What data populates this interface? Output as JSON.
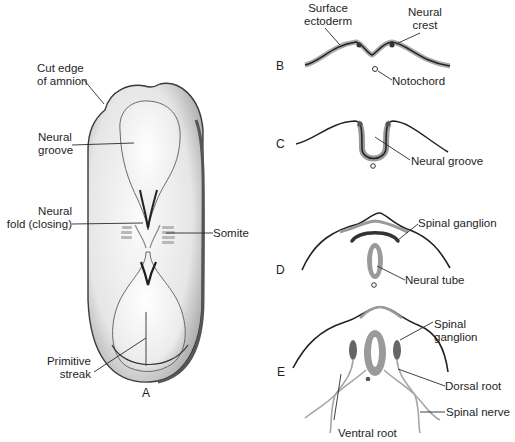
{
  "figure": {
    "panels": {
      "A": "A",
      "B": "B",
      "C": "C",
      "D": "D",
      "E": "E"
    },
    "panel_A": {
      "cut_edge_1": "Cut edge",
      "cut_edge_2": "of amnion",
      "neural_groove_1": "Neural",
      "neural_groove_2": "groove",
      "neural_fold_1": "Neural",
      "neural_fold_2": "fold (closing)",
      "somite": "Somite",
      "primitive_streak_1": "Primitive",
      "primitive_streak_2": "streak"
    },
    "panel_B": {
      "surface_ectoderm_1": "Surface",
      "surface_ectoderm_2": "ectoderm",
      "neural_crest_1": "Neural",
      "neural_crest_2": "crest",
      "notochord": "Notochord"
    },
    "panel_C": {
      "neural_groove": "Neural groove"
    },
    "panel_D": {
      "spinal_ganglion": "Spinal ganglion",
      "neural_tube": "Neural tube"
    },
    "panel_E": {
      "spinal_ganglion_1": "Spinal",
      "spinal_ganglion_2": "ganglion",
      "dorsal_root": "Dorsal root",
      "spinal_nerve": "Spinal nerve",
      "ventral_root": "Ventral root"
    },
    "colors": {
      "ectoderm": "#2a2a2a",
      "neural_tissue": "#9a9a9a",
      "embryo_fill": "#efefef",
      "embryo_shadow": "#bdbdbd"
    }
  }
}
